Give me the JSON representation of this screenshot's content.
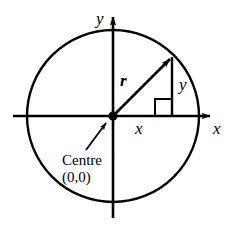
{
  "figure": {
    "type": "geometry-diagram",
    "background_color": "#ffffff",
    "stroke_color": "#000000"
  },
  "labels": {
    "y_axis": "y",
    "x_axis": "x",
    "radius": "r",
    "vertical_side": "y",
    "horizontal_side": "x",
    "centre_line1": "Centre",
    "centre_line2": "(0,0)"
  },
  "geometry": {
    "circle": {
      "cx": 113,
      "cy": 116,
      "r": 86
    },
    "origin": {
      "x": 113,
      "y": 116,
      "dot_radius": 4.5
    },
    "x_axis": {
      "x1": 13,
      "y1": 116,
      "x2": 215,
      "y2": 116,
      "arrow": "right"
    },
    "y_axis": {
      "x1": 113,
      "y1": 218,
      "x2": 113,
      "y2": 12,
      "arrow": "up"
    },
    "radius_vector": {
      "x1": 113,
      "y1": 116,
      "x2": 172,
      "y2": 57,
      "arrow": "end"
    },
    "vertical_drop": {
      "x1": 172,
      "y1": 57,
      "x2": 172,
      "y2": 116
    },
    "right_angle_marker": {
      "x": 155,
      "y": 99,
      "size": 17
    },
    "leader_arrow": {
      "x1": 86,
      "y1": 150,
      "x2": 108,
      "y2": 121,
      "arrow": "end"
    }
  },
  "label_positions": {
    "y_axis": {
      "left": 96,
      "top": 10
    },
    "x_axis": {
      "left": 213,
      "top": 120
    },
    "radius": {
      "left": 120,
      "top": 72
    },
    "vertical_side": {
      "left": 179,
      "top": 76
    },
    "horizontal_side": {
      "left": 135,
      "top": 120
    },
    "centre": {
      "left": 62,
      "top": 152
    }
  }
}
